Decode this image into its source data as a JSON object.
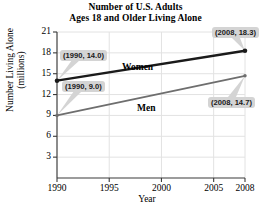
{
  "chart_data": {
    "type": "line",
    "title": "Number of U.S. Adults Ages 18 and Older Living Alone",
    "title_line1": "Number of U.S. Adults",
    "title_line2": "Ages 18 and Older Living Alone",
    "xlabel": "Year",
    "ylabel": "Number Living Alone (millions)",
    "ylabel_line1": "Number Living Alone",
    "ylabel_line2": "(millions)",
    "xlim": [
      1990,
      2008
    ],
    "ylim": [
      0,
      21
    ],
    "xticks": [
      1990,
      1995,
      2000,
      2005,
      2008
    ],
    "yticks": [
      3,
      6,
      9,
      12,
      15,
      18,
      21
    ],
    "xtick_labels": [
      "1990",
      "1995",
      "2000",
      "2005",
      "2008"
    ],
    "ytick_labels": [
      "3",
      "6",
      "9",
      "12",
      "15",
      "18",
      "21"
    ],
    "grid": true,
    "legend": "inline-labels",
    "series": [
      {
        "name": "Women",
        "color": "#1a1a1a",
        "linewidth": 2.4,
        "x": [
          1990,
          2008
        ],
        "values": [
          14.0,
          18.3
        ]
      },
      {
        "name": "Men",
        "color": "#6e6e6e",
        "linewidth": 1.8,
        "x": [
          1990,
          2008
        ],
        "values": [
          9.0,
          14.7
        ]
      }
    ],
    "annotations": [
      {
        "id": "women-start",
        "text": "(1990, 14.0)",
        "point": [
          1990,
          14.0
        ]
      },
      {
        "id": "men-start",
        "text": "(1990, 9.0)",
        "point": [
          1990,
          9.0
        ]
      },
      {
        "id": "women-end",
        "text": "(2008, 18.3)",
        "point": [
          2008,
          18.3
        ]
      },
      {
        "id": "men-end",
        "text": "(2008, 14.7)",
        "point": [
          2008,
          14.7
        ]
      }
    ]
  },
  "colors": {
    "women_line": "#1a1a1a",
    "men_line": "#6e6e6e",
    "axis": "#3a3a3a",
    "grid": "#e2e2e2",
    "callout_bg": "#d4d4d4",
    "text": "#000000"
  }
}
